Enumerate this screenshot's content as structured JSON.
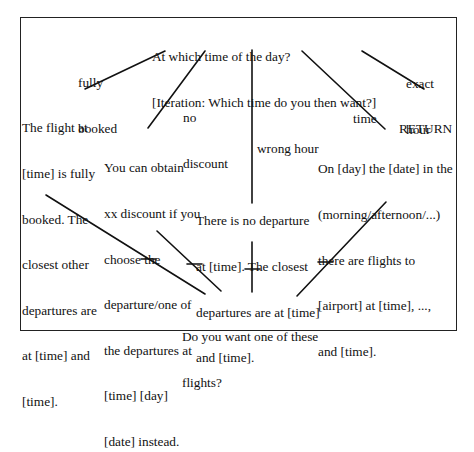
{
  "diagram": {
    "type": "dialogue-flow",
    "root": {
      "line1": "At which time of the day?",
      "line2": "[Iteration: Which time do you then want?]"
    },
    "branches": [
      {
        "label_lines": [
          "fully",
          "booked"
        ],
        "response_lines": [
          "The flight at",
          "[time] is fully",
          "booked. The",
          "closest other",
          "departures are",
          "at [time] and",
          "[time]."
        ],
        "leads_to": "confirm"
      },
      {
        "label_lines": [
          "no",
          "discount"
        ],
        "response_lines": [
          "You can obtain",
          "xx discount if you",
          "choose the",
          "departure/one of",
          "the departures at",
          "[time] [day]",
          "[date] instead."
        ],
        "leads_to": "confirm"
      },
      {
        "label_lines": [
          "wrong hour"
        ],
        "response_lines": [
          "There is no departure",
          "at [time]. The closest",
          "departures are at [time]",
          "and [time]."
        ],
        "leads_to": "confirm"
      },
      {
        "label_lines": [
          "time"
        ],
        "response_lines": [
          "On [day] the [date] in the",
          "(morning/afternoon/...)",
          "there are flights to",
          "[airport] at [time], ...,",
          "and [time]."
        ],
        "leads_to": "confirm"
      },
      {
        "label_lines": [
          "exact",
          "hour"
        ],
        "response_lines": [
          "RETURN"
        ],
        "leads_to": null
      }
    ],
    "confirm": {
      "line1": "Do you want one of these",
      "line2": "flights?"
    }
  }
}
